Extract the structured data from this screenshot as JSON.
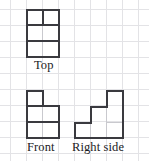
{
  "figure": {
    "kind": "orthographic-projection-worksheet",
    "background": "#ffffff",
    "grid_color": "#e3e3e6",
    "grid_spacing_px": 16,
    "stroke_color": "#3a3a3f",
    "interior_line_color": "#c9c9ce",
    "label_color": "#1b1b1e"
  },
  "views": [
    {
      "id": "top",
      "label": "Top",
      "label_left": 34,
      "label_top": 58,
      "origin": {
        "x": 26,
        "y": 9
      },
      "cols": 2,
      "rows": 3,
      "cell": 16,
      "description": "2 wide by 3 tall rectangle of squares",
      "outline": {
        "x": 26,
        "y": 9,
        "w": 32,
        "h": 48
      },
      "interior_dark_lines": [
        {
          "type": "v",
          "x": 42,
          "y": 9,
          "len": 16
        },
        {
          "type": "h",
          "x": 26,
          "y": 25,
          "len": 32
        },
        {
          "type": "h",
          "x": 26,
          "y": 41,
          "len": 32
        }
      ],
      "interior_faint_lines": [
        {
          "type": "v",
          "x": 42,
          "y": 25,
          "len": 32
        }
      ]
    },
    {
      "id": "front",
      "label": "Front",
      "label_left": 26,
      "label_top": 140,
      "origin": {
        "x": 26,
        "y": 90
      },
      "cell": 16,
      "description": "one square on top-left above a 2 by 2 block",
      "cells": [
        {
          "col": 0,
          "row": 0
        },
        {
          "col": 0,
          "row": 1
        },
        {
          "col": 1,
          "row": 1
        },
        {
          "col": 0,
          "row": 2
        },
        {
          "col": 1,
          "row": 2
        }
      ],
      "outline_path": [
        {
          "x": 26,
          "y": 90
        },
        {
          "x": 42,
          "y": 90
        },
        {
          "x": 42,
          "y": 106
        },
        {
          "x": 58,
          "y": 106
        },
        {
          "x": 58,
          "y": 138
        },
        {
          "x": 26,
          "y": 138
        }
      ],
      "interior_dark_lines": [
        {
          "type": "h",
          "x": 26,
          "y": 106,
          "len": 16
        },
        {
          "type": "h",
          "x": 26,
          "y": 122,
          "len": 32
        }
      ],
      "interior_faint_lines": [
        {
          "type": "v",
          "x": 42,
          "y": 106,
          "len": 32
        }
      ]
    },
    {
      "id": "right-side",
      "label": "Right side",
      "label_left": 74,
      "label_top": 140,
      "origin": {
        "x": 74,
        "y": 90
      },
      "cell": 16,
      "description": "staircase rising to the right, three columns tall 1, 2, 3",
      "cells": [
        {
          "col": 0,
          "row": 2
        },
        {
          "col": 1,
          "row": 1
        },
        {
          "col": 1,
          "row": 2
        },
        {
          "col": 2,
          "row": 0
        },
        {
          "col": 2,
          "row": 1
        },
        {
          "col": 2,
          "row": 2
        }
      ],
      "outline_path": [
        {
          "x": 74,
          "y": 122
        },
        {
          "x": 90,
          "y": 122
        },
        {
          "x": 90,
          "y": 106
        },
        {
          "x": 106,
          "y": 106
        },
        {
          "x": 106,
          "y": 90
        },
        {
          "x": 122,
          "y": 90
        },
        {
          "x": 122,
          "y": 138
        },
        {
          "x": 74,
          "y": 138
        }
      ],
      "interior_faint_lines": [
        {
          "type": "v",
          "x": 90,
          "y": 122,
          "len": 16
        },
        {
          "type": "v",
          "x": 106,
          "y": 106,
          "len": 32
        },
        {
          "type": "h",
          "x": 106,
          "y": 122,
          "len": 16
        }
      ]
    }
  ]
}
